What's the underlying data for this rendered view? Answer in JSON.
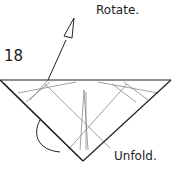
{
  "diagram": {
    "step_number": "18",
    "labels": {
      "rotate": "Rotate.",
      "unfold": "Unfold."
    },
    "colors": {
      "line": "#222222",
      "crease": "#888888",
      "background": "#ffffff"
    }
  }
}
